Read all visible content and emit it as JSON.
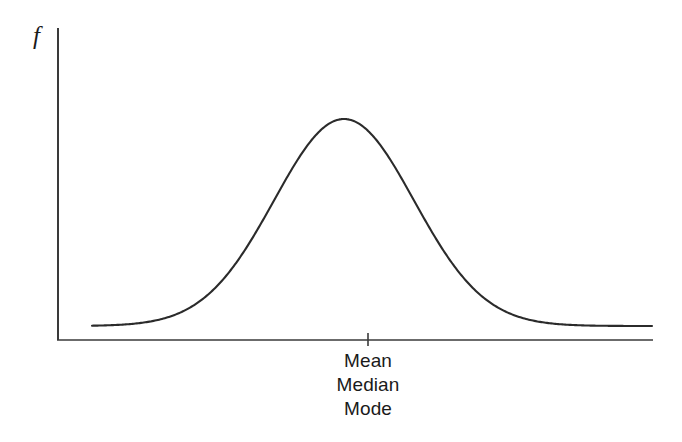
{
  "figure": {
    "y_axis_label": "f",
    "center_labels": [
      "Mean",
      "Median",
      "Mode"
    ],
    "line_color": "#2b2b2b",
    "axis_color": "#3a3a3a",
    "background_color": "#ffffff"
  },
  "chart_data": {
    "type": "line",
    "title": "",
    "subtitle": "",
    "xlabel": "",
    "ylabel": "f",
    "grid": false,
    "legend": null,
    "annotations": [
      {
        "text": "Mean",
        "x": 0,
        "y": 0,
        "placement": "below-axis-centered"
      },
      {
        "text": "Median",
        "x": 0,
        "y": 0,
        "placement": "below-axis-centered"
      },
      {
        "text": "Mode",
        "x": 0,
        "y": 0,
        "placement": "below-axis-centered"
      }
    ],
    "ticks": {
      "x": [
        {
          "value": 0,
          "label": ""
        }
      ],
      "y": []
    },
    "xlim": [
      -3.6,
      4.4
    ],
    "ylim": [
      0,
      1.05
    ],
    "series": [
      {
        "name": "normal density",
        "x": [
          -3.6,
          -3.2,
          -2.8,
          -2.4,
          -2.0,
          -1.6,
          -1.2,
          -0.8,
          -0.4,
          0.0,
          0.4,
          0.8,
          1.2,
          1.6,
          2.0,
          2.4,
          2.8,
          3.2,
          3.6,
          4.0,
          4.4
        ],
        "y": [
          0.0015,
          0.006,
          0.0198,
          0.0561,
          0.1353,
          0.278,
          0.4868,
          0.7261,
          0.9231,
          1.0,
          0.9231,
          0.7261,
          0.4868,
          0.278,
          0.1353,
          0.0561,
          0.0198,
          0.006,
          0.0015,
          0.0003,
          0.0001
        ]
      }
    ]
  }
}
